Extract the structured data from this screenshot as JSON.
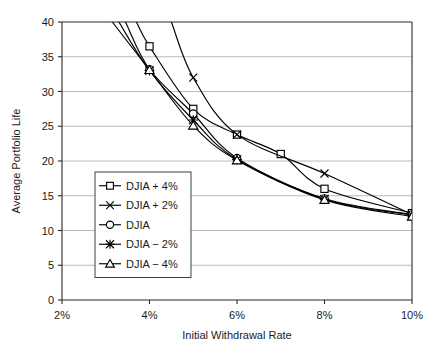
{
  "chart_data": {
    "type": "line",
    "title": "",
    "xlabel": "Initial Withdrawal Rate",
    "ylabel": "Average Portfolio Life",
    "xlim": [
      2,
      10
    ],
    "ylim": [
      0,
      40
    ],
    "xticks": [
      2,
      4,
      6,
      8,
      10
    ],
    "xtick_labels": [
      "2%",
      "4%",
      "6%",
      "8%",
      "10%"
    ],
    "yticks": [
      0,
      5,
      10,
      15,
      20,
      25,
      30,
      35,
      40
    ],
    "ytick_labels": [
      "0",
      "5",
      "10",
      "15",
      "20",
      "25",
      "30",
      "35",
      "40"
    ],
    "grid": "horizontal",
    "legend_position": "center-left-inside",
    "x": [
      4,
      5,
      6,
      8,
      10
    ],
    "series": [
      {
        "name": "DJIA + 4%",
        "marker": "open-square",
        "values": [
          36.5,
          27.5,
          23.8,
          21.0,
          16.0,
          12.5
        ],
        "x_values": [
          4,
          5,
          6,
          7,
          8,
          10
        ],
        "enters_top_at_x": 3.7
      },
      {
        "name": "DJIA + 2%",
        "marker": "cross-x",
        "values": [
          32.0,
          23.8,
          18.2,
          12.3
        ],
        "x_values": [
          5,
          6,
          8,
          10
        ],
        "enters_top_at_x": 4.5
      },
      {
        "name": "DJIA",
        "marker": "open-circle",
        "values": [
          33.2,
          26.8,
          20.4,
          14.6,
          12.3
        ],
        "x_values": [
          4,
          5,
          6,
          8,
          10
        ],
        "enters_top_at_x": 3.45
      },
      {
        "name": "DJIA − 2%",
        "marker": "solid-star",
        "values": [
          33.0,
          25.9,
          20.2,
          14.5,
          12.2
        ],
        "x_values": [
          4,
          5,
          6,
          8,
          10
        ],
        "enters_top_at_x": 3.3
      },
      {
        "name": "DJIA − 4%",
        "marker": "open-triangle",
        "values": [
          33.1,
          25.1,
          20.1,
          14.4,
          12.0
        ],
        "x_values": [
          4,
          5,
          6,
          8,
          10
        ],
        "enters_top_at_x": 3.15
      }
    ],
    "legend": [
      {
        "label": "DJIA + 4%",
        "marker": "open-square"
      },
      {
        "label": "DJIA + 2%",
        "marker": "cross-x"
      },
      {
        "label": "DJIA",
        "marker": "open-circle"
      },
      {
        "label": "DJIA − 2%",
        "marker": "solid-star"
      },
      {
        "label": "DJIA − 4%",
        "marker": "open-triangle"
      }
    ],
    "colors": {
      "line": "#000000",
      "grid": "#a8a8a8",
      "axis": "#2b2b2b",
      "text": "#1a1a1a",
      "background": "#ffffff"
    }
  }
}
